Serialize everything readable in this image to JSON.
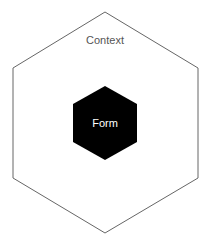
{
  "diagram": {
    "outer": {
      "label": "Context",
      "stroke": "#666666",
      "fill": "#ffffff",
      "text_color": "#555555"
    },
    "inner": {
      "label": "Form",
      "fill": "#000000",
      "text_color": "#ffffff"
    }
  }
}
